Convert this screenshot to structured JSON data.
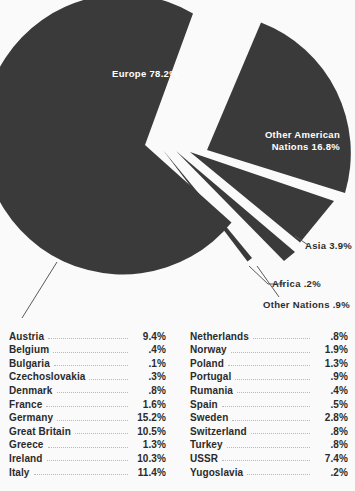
{
  "chart_data": {
    "type": "pie",
    "title": "",
    "units": "percent",
    "slices": [
      {
        "label": "Europe",
        "value": 78.2,
        "display": "Europe 78.2%",
        "exploded": false,
        "label_placement": "inside"
      },
      {
        "label": "Other American Nations",
        "value": 16.8,
        "display": "Other American Nations 16.8%",
        "exploded": true,
        "label_placement": "inside"
      },
      {
        "label": "Asia",
        "value": 3.9,
        "display": "Asia 3.9%",
        "exploded": true,
        "label_placement": "outside"
      },
      {
        "label": "Africa",
        "value": 0.2,
        "display": "Africa .2%",
        "exploded": true,
        "label_placement": "outside"
      },
      {
        "label": "Other Nations",
        "value": 0.9,
        "display": "Other Nations .9%",
        "exploded": true,
        "label_placement": "outside"
      }
    ],
    "legend_position": "below",
    "grid": false,
    "colors": {
      "slice_fill": "#3a3a3a",
      "background": "#fafafa",
      "inside_label": "#ffffff",
      "outside_label": "#2e2e2e",
      "leader_line": "#6f6f6f",
      "dot_leader": "#b9b9b9"
    }
  },
  "pie_labels": {
    "europe": "Europe  78.2%",
    "other_american_line1": "Other  American",
    "other_american_line2": "Nations  16.8%",
    "asia": "Asia  3.9%",
    "africa": "Africa  .2%",
    "other_nations": "Other  Nations  .9%"
  },
  "legend": {
    "left_column": [
      {
        "name": "Austria",
        "value": "9.4%"
      },
      {
        "name": "Belgium",
        "value": ".4%"
      },
      {
        "name": "Bulgaria",
        "value": ".1%"
      },
      {
        "name": "Czechoslovakia",
        "value": ".3%"
      },
      {
        "name": "Denmark",
        "value": ".8%"
      },
      {
        "name": "France",
        "value": "1.6%"
      },
      {
        "name": "Germany",
        "value": "15.2%"
      },
      {
        "name": "Great Britain",
        "value": "10.5%"
      },
      {
        "name": "Greece",
        "value": "1.3%"
      },
      {
        "name": "Ireland",
        "value": "10.3%"
      },
      {
        "name": "Italy",
        "value": "11.4%"
      }
    ],
    "right_column": [
      {
        "name": "Netherlands",
        "value": ".8%"
      },
      {
        "name": "Norway",
        "value": "1.9%"
      },
      {
        "name": "Poland",
        "value": "1.3%"
      },
      {
        "name": "Portugal",
        "value": ".9%"
      },
      {
        "name": "Rumania",
        "value": ".4%"
      },
      {
        "name": "Spain",
        "value": ".5%"
      },
      {
        "name": "Sweden",
        "value": "2.8%"
      },
      {
        "name": "Switzerland",
        "value": ".8%"
      },
      {
        "name": "Turkey",
        "value": ".8%"
      },
      {
        "name": "USSR",
        "value": "7.4%"
      },
      {
        "name": "Yugoslavia",
        "value": ".2%"
      }
    ]
  }
}
